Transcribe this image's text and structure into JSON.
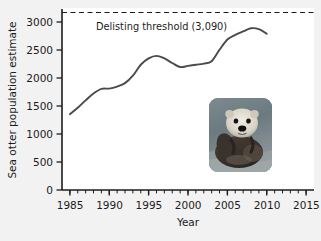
{
  "chart_data": {
    "type": "line",
    "title": "",
    "xlabel": "Year",
    "ylabel": "Sea otter population estimate",
    "xlim": [
      1984,
      2016
    ],
    "ylim": [
      0,
      3150
    ],
    "grid": false,
    "legend": null,
    "x_ticks": [
      1985,
      1990,
      1995,
      2000,
      2005,
      2010,
      2015
    ],
    "x_tick_labels": [
      "1985",
      "1990",
      "1995",
      "2000",
      "2005",
      "2010",
      "2015"
    ],
    "x_minor_tick_step": 1,
    "y_ticks": [
      0,
      500,
      1000,
      1500,
      2000,
      2500,
      3000
    ],
    "y_tick_labels": [
      "0",
      "500",
      "1000",
      "1500",
      "2000",
      "2500",
      "3000"
    ],
    "series": [
      {
        "name": "Sea otter population estimate",
        "color": "#4a4a4a",
        "x": [
          1985,
          1986,
          1987,
          1988,
          1989,
          1990,
          1991,
          1992,
          1993,
          1994,
          1995,
          1996,
          1997,
          1998,
          1999,
          2000,
          2001,
          2002,
          2003,
          2004,
          2005,
          2006,
          2007,
          2008,
          2009,
          2010
        ],
        "values": [
          1320,
          1430,
          1560,
          1680,
          1760,
          1765,
          1800,
          1860,
          1990,
          2180,
          2290,
          2335,
          2290,
          2210,
          2140,
          2160,
          2180,
          2200,
          2240,
          2440,
          2620,
          2700,
          2760,
          2815,
          2800,
          2720
        ]
      }
    ],
    "annotations": [
      {
        "name": "delisting-threshold",
        "label": "Delisting threshold (3,090)",
        "type": "hline",
        "value": 3090,
        "style": "dashed",
        "color": "#1c1c1c"
      }
    ],
    "inset_image": {
      "name": "sea-otter-photo",
      "alt": "Sea otter floating on its back in water"
    }
  },
  "colors": {
    "figure_background": "#f2f2f2",
    "plot_background": "#ffffff",
    "axis": "#1c1c1c",
    "line": "#4a4a4a",
    "text": "#1c1c1c"
  }
}
